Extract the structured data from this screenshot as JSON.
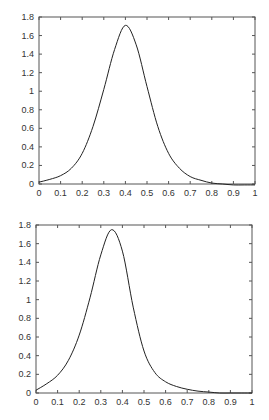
{
  "chart_data": [
    {
      "type": "line",
      "title": "",
      "xlabel": "",
      "ylabel": "",
      "xlim": [
        0,
        1
      ],
      "ylim": [
        0,
        1.8
      ],
      "grid": false,
      "legend": null,
      "xticks": [
        "0",
        "0.1",
        "0.2",
        "0.3",
        "0.4",
        "0.5",
        "0.6",
        "0.7",
        "0.8",
        "0.9",
        "1"
      ],
      "yticks": [
        "0",
        "0.2",
        "0.4",
        "0.6",
        "0.8",
        "1",
        "1.2",
        "1.4",
        "1.6",
        "1.8"
      ],
      "series": [
        {
          "name": "curve",
          "x": [
            0,
            0.05,
            0.1,
            0.15,
            0.2,
            0.25,
            0.3,
            0.35,
            0.4,
            0.45,
            0.5,
            0.55,
            0.6,
            0.65,
            0.7,
            0.75,
            0.8,
            0.85,
            0.9,
            0.95,
            1.0
          ],
          "y": [
            0.02,
            0.05,
            0.09,
            0.17,
            0.33,
            0.62,
            1.02,
            1.45,
            1.71,
            1.5,
            1.05,
            0.62,
            0.33,
            0.17,
            0.08,
            0.04,
            0.01,
            0.0,
            -0.01,
            -0.01,
            -0.01
          ]
        }
      ],
      "frame": {
        "left": 39,
        "right": 255,
        "top": 17,
        "bottom": 184
      }
    },
    {
      "type": "line",
      "title": "",
      "xlabel": "",
      "ylabel": "",
      "xlim": [
        0,
        1
      ],
      "ylim": [
        0,
        1.8
      ],
      "grid": false,
      "legend": null,
      "xticks": [
        "0",
        "0.1",
        "0.2",
        "0.3",
        "0.4",
        "0.5",
        "0.6",
        "0.7",
        "0.8",
        "0.9",
        "1"
      ],
      "yticks": [
        "0",
        "0.2",
        "0.4",
        "0.6",
        "0.8",
        "1",
        "1.2",
        "1.4",
        "1.6",
        "1.8"
      ],
      "series": [
        {
          "name": "curve",
          "x": [
            0,
            0.05,
            0.1,
            0.15,
            0.2,
            0.25,
            0.3,
            0.35,
            0.4,
            0.45,
            0.5,
            0.55,
            0.6,
            0.65,
            0.7,
            0.75,
            0.8,
            0.85,
            0.9,
            0.95,
            1.0
          ],
          "y": [
            0.03,
            0.1,
            0.19,
            0.35,
            0.62,
            1.02,
            1.48,
            1.75,
            1.52,
            0.92,
            0.45,
            0.22,
            0.12,
            0.07,
            0.04,
            0.02,
            0.01,
            0.0,
            0.0,
            0.0,
            0.0
          ]
        }
      ],
      "frame": {
        "left": 36,
        "right": 252,
        "top": 225,
        "bottom": 393
      }
    }
  ]
}
